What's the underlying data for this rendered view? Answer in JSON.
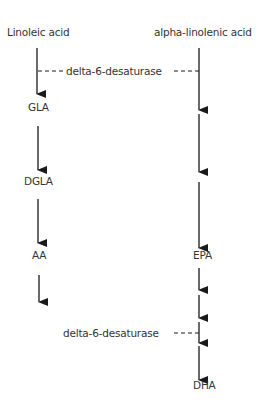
{
  "diagram": {
    "type": "metabolic-pathway",
    "colors": {
      "line": "#1a1a1a",
      "text": "#333333",
      "background": "#ffffff"
    },
    "columns": [
      {
        "id": "omega-6",
        "start": "Linoleic acid",
        "steps": [
          "GLA",
          "DGLA",
          "AA"
        ]
      },
      {
        "id": "omega-3",
        "start": "alpha-linolenic acid",
        "steps": [
          "EPA",
          "DHA"
        ]
      }
    ],
    "enzymes": {
      "top": "delta-6-desaturase",
      "bottom": "delta-6-desaturase"
    }
  }
}
